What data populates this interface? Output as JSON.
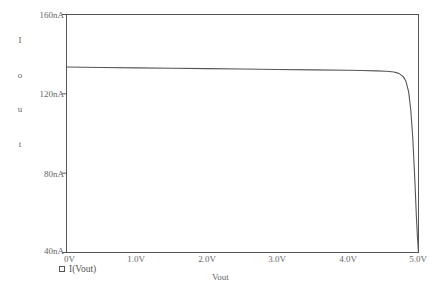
{
  "chart_data": {
    "type": "line",
    "title": "",
    "xlabel": "Vout",
    "ylabel": "Iout",
    "ylabel_stacked": [
      "I",
      "o",
      "u",
      "t"
    ],
    "xlim": [
      0,
      5.0
    ],
    "ylim": [
      40,
      160
    ],
    "xunit": "V",
    "yunit": "nA",
    "grid": false,
    "legend_position": "below-left",
    "axis_color": "#555555",
    "curve_color": "#555555",
    "background": "#ffffff",
    "xticks": [
      {
        "value": 0,
        "label": "0V"
      },
      {
        "value": 1.0,
        "label": "1.0V"
      },
      {
        "value": 2.0,
        "label": "2.0V"
      },
      {
        "value": 3.0,
        "label": "3.0V"
      },
      {
        "value": 4.0,
        "label": "4.0V"
      },
      {
        "value": 5.0,
        "label": "5.0V"
      }
    ],
    "yticks": [
      {
        "value": 160,
        "label": "160nA"
      },
      {
        "value": 120,
        "label": "120nA"
      },
      {
        "value": 80,
        "label": "80nA"
      },
      {
        "value": 40,
        "label": "40nA"
      }
    ],
    "series": [
      {
        "name": "I(Vout)",
        "marker": "square",
        "x": [
          0.0,
          0.25,
          0.5,
          1.0,
          1.5,
          2.0,
          2.5,
          3.0,
          3.5,
          4.0,
          4.2,
          4.4,
          4.55,
          4.65,
          4.72,
          4.78,
          4.82,
          4.86,
          4.89,
          4.92,
          4.95,
          4.97,
          4.985,
          5.0
        ],
        "values": [
          133.5,
          133.4,
          133.3,
          133.1,
          132.9,
          132.7,
          132.5,
          132.3,
          132.1,
          131.9,
          131.8,
          131.6,
          131.4,
          131.0,
          130.3,
          128.8,
          126.5,
          121.0,
          112.0,
          97.0,
          75.0,
          58.0,
          48.0,
          40.0
        ]
      }
    ],
    "legend": [
      {
        "label": "I(Vout)",
        "marker": "square"
      }
    ]
  }
}
